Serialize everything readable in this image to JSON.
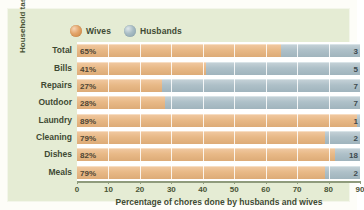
{
  "figure": {
    "background_color": "#e5ecd4",
    "plot_background_color": "#ffffff"
  },
  "legend": {
    "position": "top",
    "items": [
      {
        "label": "Wives",
        "color": "#e3a469",
        "icon": "sphere-icon"
      },
      {
        "label": "Husbands",
        "color": "#a8bcc4",
        "icon": "sphere-icon"
      }
    ]
  },
  "chart_data": {
    "type": "bar",
    "orientation": "horizontal",
    "stacked": true,
    "title": "",
    "xlabel": "Percentage of chores done by husbands and wives",
    "ylabel": "Household tasks",
    "xlim": [
      0,
      90
    ],
    "xticks": [
      0,
      10,
      20,
      30,
      40,
      50,
      60,
      70,
      80,
      90
    ],
    "grid": true,
    "categories": [
      "Total",
      "Bills",
      "Repairs",
      "Outdoor",
      "Laundry",
      "Cleaning",
      "Dishes",
      "Meals"
    ],
    "series": [
      {
        "name": "Wives",
        "color": "#e3a469",
        "values": [
          65,
          41,
          27,
          28,
          89,
          79,
          82,
          79
        ],
        "labels": [
          "65%",
          "41%",
          "27%",
          "28%",
          "89%",
          "79%",
          "82%",
          "79%"
        ]
      },
      {
        "name": "Husbands",
        "color": "#a8bcc4",
        "values": [
          35,
          59,
          73,
          72,
          11,
          21,
          18,
          21
        ],
        "labels": [
          "3",
          "5",
          "7",
          "7",
          "1",
          "2",
          "18",
          "2"
        ],
        "labels_clipped": true
      }
    ]
  }
}
